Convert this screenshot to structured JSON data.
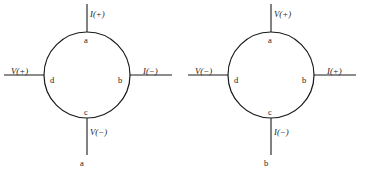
{
  "figure": {
    "type": "four-terminal-measurement-configurations",
    "background_color": "#ffffff",
    "stroke_color": "#1a1a1a",
    "diagram_count": 2
  },
  "geometry": {
    "circle_center_x": 87,
    "circle_center_y": 75,
    "circle_radius": 43,
    "lead_top_end_y": 4,
    "lead_bottom_end_y": 155,
    "lead_left_end_x": 4,
    "lead_right_end_x": 172
  },
  "diagrams": [
    {
      "id": "left-configuration",
      "nodes": {
        "top": "a",
        "right": "b",
        "bottom": "c",
        "left": "d"
      },
      "terminals": {
        "top": "I(+)",
        "right": "I(−)",
        "bottom": "V(−)",
        "left": "V(+)"
      },
      "outer_endpoints": {
        "bottom": "a"
      }
    },
    {
      "id": "right-configuration",
      "nodes": {
        "top": "a",
        "right": "b",
        "bottom": "c",
        "left": "d"
      },
      "terminals": {
        "top": "V(+)",
        "right": "I(+)",
        "bottom": "I(−)",
        "left": "V(−)"
      },
      "outer_endpoints": {
        "bottom": "b"
      }
    }
  ]
}
